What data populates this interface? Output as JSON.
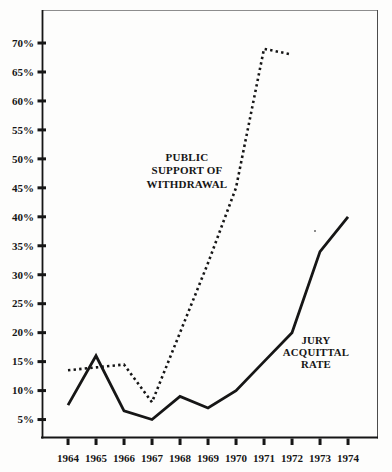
{
  "page": {
    "background": "#fdfdfc"
  },
  "chart_data": {
    "type": "line",
    "title": "",
    "xlabel": "",
    "ylabel": "",
    "grid": "off",
    "legend": "inline-labels",
    "x": [
      1964,
      1965,
      1966,
      1967,
      1968,
      1969,
      1970,
      1971,
      1972,
      1973,
      1974
    ],
    "x_tick_labels": [
      "1964",
      "1965",
      "1966",
      "1967",
      "1968",
      "1969",
      "1970",
      "1971",
      "1972",
      "1973",
      "1974"
    ],
    "y_ticks": [
      {
        "value": 70,
        "label": "70%"
      },
      {
        "value": 65,
        "label": "65%"
      },
      {
        "value": 60,
        "label": "60%"
      },
      {
        "value": 55,
        "label": "55%"
      },
      {
        "value": 50,
        "label": "50%"
      },
      {
        "value": 45,
        "label": "45%"
      },
      {
        "value": 40,
        "label": "40%"
      },
      {
        "value": 35,
        "label": "35%"
      },
      {
        "value": 30,
        "label": "30%"
      },
      {
        "value": 25,
        "label": "25%"
      },
      {
        "value": 20,
        "label": "20%"
      },
      {
        "value": 15,
        "label": "15%"
      },
      {
        "value": 10,
        "label": "10%"
      },
      {
        "value": 5,
        "label": "5%"
      }
    ],
    "xlim": [
      1963.07,
      1975.07
    ],
    "ylim": [
      1.9,
      75.7
    ],
    "series": [
      {
        "name": "Public support of withdrawal",
        "line_style": "dotted",
        "values": [
          13.5,
          14,
          14.5,
          8,
          20,
          32,
          45,
          69,
          68,
          null,
          null
        ]
      },
      {
        "name": "Jury acquittal rate",
        "line_style": "solid",
        "values": [
          7.5,
          16,
          6.5,
          5,
          9,
          7,
          10,
          15,
          20,
          34,
          40
        ]
      }
    ],
    "annotations": [
      {
        "target": "Public support of withdrawal",
        "lines": [
          "PUBLIC",
          "SUPPORT OF",
          "WITHDRAWAL"
        ]
      },
      {
        "target": "Jury acquittal rate",
        "lines": [
          "JURY",
          "ACQUITTAL",
          "RATE"
        ]
      }
    ],
    "colors": {
      "ink": "#161616",
      "border_top": "#8d8d8d",
      "border_right": "#4c4c4c",
      "background": "#fdfdfc"
    }
  }
}
